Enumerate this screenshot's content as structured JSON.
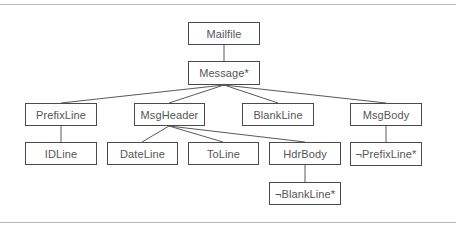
{
  "diagram": {
    "type": "tree",
    "nodes": {
      "mailfile": {
        "label": "Mailfile",
        "x": 188,
        "y": 22,
        "w": 72,
        "h": 23
      },
      "message": {
        "label": "Message*",
        "x": 188,
        "y": 61,
        "w": 72,
        "h": 24
      },
      "prefixline": {
        "label": "PrefixLine",
        "x": 25,
        "y": 103,
        "w": 72,
        "h": 23
      },
      "msgheader": {
        "label": "MsgHeader",
        "x": 134,
        "y": 103,
        "w": 71,
        "h": 23
      },
      "blankline": {
        "label": "BlankLine",
        "x": 242,
        "y": 103,
        "w": 72,
        "h": 23
      },
      "msgbody": {
        "label": "MsgBody",
        "x": 350,
        "y": 103,
        "w": 72,
        "h": 23
      },
      "idline": {
        "label": "IDLine",
        "x": 25,
        "y": 142,
        "w": 72,
        "h": 23
      },
      "dateline": {
        "label": "DateLine",
        "x": 107,
        "y": 142,
        "w": 71,
        "h": 23
      },
      "toline": {
        "label": "ToLine",
        "x": 188,
        "y": 142,
        "w": 71,
        "h": 23
      },
      "hdrbody": {
        "label": "HdrBody",
        "x": 269,
        "y": 142,
        "w": 72,
        "h": 23
      },
      "notprefixline": {
        "label": "¬PrefixLine*",
        "x": 350,
        "y": 142,
        "w": 72,
        "h": 24
      },
      "notblankline": {
        "label": "¬BlankLine*",
        "x": 269,
        "y": 182,
        "w": 72,
        "h": 23
      }
    },
    "edges": [
      [
        "Mailfile",
        "Message*"
      ],
      [
        "Message*",
        "PrefixLine"
      ],
      [
        "Message*",
        "MsgHeader"
      ],
      [
        "Message*",
        "BlankLine"
      ],
      [
        "Message*",
        "MsgBody"
      ],
      [
        "PrefixLine",
        "IDLine"
      ],
      [
        "MsgHeader",
        "DateLine"
      ],
      [
        "MsgHeader",
        "ToLine"
      ],
      [
        "MsgHeader",
        "HdrBody"
      ],
      [
        "HdrBody",
        "¬BlankLine*"
      ],
      [
        "MsgBody",
        "¬PrefixLine*"
      ]
    ]
  }
}
